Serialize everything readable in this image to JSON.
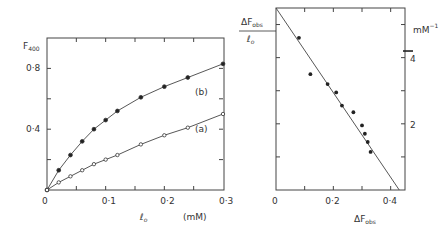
{
  "chart_data": [
    {
      "type": "line",
      "panel": "left",
      "ylabel": "F400",
      "xlabel": "l0",
      "xunit": "(mM)",
      "xlim": [
        0,
        0.3
      ],
      "ylim": [
        0,
        1.0
      ],
      "xticks": [
        "0",
        "0·1",
        "0·2",
        "0·3"
      ],
      "yticks": [
        "0·4",
        "0·8"
      ],
      "grid": false,
      "series": [
        {
          "name": "(b)",
          "marker": "filled-circle",
          "x": [
            0.0,
            0.02,
            0.04,
            0.06,
            0.08,
            0.1,
            0.12,
            0.16,
            0.2,
            0.24,
            0.3
          ],
          "y": [
            0.0,
            0.13,
            0.23,
            0.32,
            0.4,
            0.46,
            0.52,
            0.61,
            0.68,
            0.74,
            0.83
          ]
        },
        {
          "name": "(a)",
          "marker": "open-circle",
          "x": [
            0.0,
            0.02,
            0.04,
            0.06,
            0.08,
            0.1,
            0.12,
            0.16,
            0.2,
            0.24,
            0.3
          ],
          "y": [
            0.0,
            0.05,
            0.09,
            0.13,
            0.17,
            0.2,
            0.23,
            0.3,
            0.36,
            0.41,
            0.5
          ]
        }
      ]
    },
    {
      "type": "scatter",
      "panel": "right",
      "ylabel": "ΔFobs / l0",
      "yunit": "mM⁻¹",
      "xlabel": "ΔFobs",
      "xlim": [
        0,
        0.45
      ],
      "ylim": [
        0,
        5.5
      ],
      "xticks": [
        "0",
        "0·2",
        "0·4"
      ],
      "yticks": [
        "2",
        "4"
      ],
      "grid": false,
      "points": {
        "x": [
          0.08,
          0.12,
          0.18,
          0.21,
          0.23,
          0.27,
          0.3,
          0.31,
          0.32,
          0.33
        ],
        "y": [
          4.6,
          3.5,
          3.2,
          2.95,
          2.55,
          2.35,
          1.95,
          1.7,
          1.45,
          1.15
        ]
      },
      "fit_line": {
        "x": [
          0,
          0.43
        ],
        "y": [
          5.5,
          0
        ]
      },
      "marker_right_axis": 4.2
    }
  ]
}
